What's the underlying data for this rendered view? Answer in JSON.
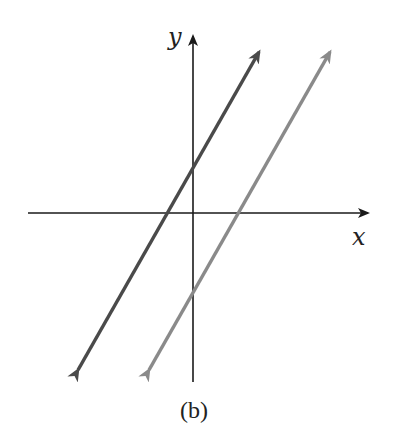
{
  "figure": {
    "caption": "(b)",
    "axes": {
      "x_label": "x",
      "y_label": "y",
      "origin_px": [
        193,
        213
      ],
      "axis_color": "#1a1a1a"
    },
    "lines": [
      {
        "name": "dark-line",
        "color": "#4a4a4a",
        "description": "line with positive slope, positive y-intercept, negative x-intercept",
        "start_px": [
          72,
          380
        ],
        "end_px": [
          265,
          42
        ],
        "x_intercept_px": [
          166,
          213
        ],
        "y_intercept_px": [
          193,
          167
        ]
      },
      {
        "name": "gray-line",
        "color": "#8a8a8a",
        "description": "parallel line with positive slope, negative y-intercept, positive x-intercept",
        "start_px": [
          143,
          380
        ],
        "end_px": [
          336,
          42
        ],
        "x_intercept_px": [
          239,
          213
        ],
        "y_intercept_px": [
          193,
          296
        ]
      }
    ]
  }
}
